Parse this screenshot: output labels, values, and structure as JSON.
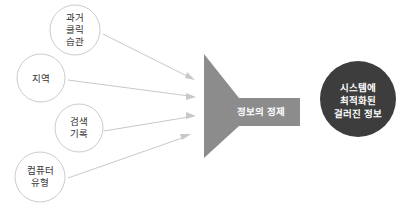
{
  "diagram": {
    "type": "funnel-flow",
    "canvas": {
      "width": 408,
      "height": 215,
      "background": "#ffffff"
    },
    "colors": {
      "input_circle_stroke": "#cccccc",
      "input_circle_fill": "#ffffff",
      "input_label": "#333333",
      "arrow": "#c8c8c8",
      "funnel": "#8c8c8c",
      "funnel_label": "#ffffff",
      "output_circle": "#3d3d3d",
      "output_label": "#ffffff"
    },
    "inputs": [
      {
        "id": "past-click-habits",
        "lines": [
          "과거",
          "클릭",
          "습관"
        ],
        "cx": 75,
        "cy": 30,
        "r": 25
      },
      {
        "id": "region",
        "lines": [
          "지역"
        ],
        "cx": 41,
        "cy": 78,
        "r": 24
      },
      {
        "id": "search-history",
        "lines": [
          "검색",
          "기록"
        ],
        "cx": 79,
        "cy": 128,
        "r": 24
      },
      {
        "id": "computer-type",
        "lines": [
          "컴퓨터",
          "유형"
        ],
        "cx": 40,
        "cy": 177,
        "r": 25
      }
    ],
    "arrows": [
      {
        "id": "arrow-past-click-habits",
        "x1": 103,
        "y1": 34,
        "x2": 194,
        "y2": 79
      },
      {
        "id": "arrow-region",
        "x1": 68,
        "y1": 80,
        "x2": 194,
        "y2": 97
      },
      {
        "id": "arrow-search-history",
        "x1": 104,
        "y1": 131,
        "x2": 194,
        "y2": 116
      },
      {
        "id": "arrow-computer-type",
        "x1": 68,
        "y1": 178,
        "x2": 190,
        "y2": 136
      }
    ],
    "funnel": {
      "id": "information-refinement",
      "label": "정보의 정제",
      "points": "204,54 204,158 239,126 300,126 300,98 239,98 204,54",
      "label_x": 260,
      "label_y": 110
    },
    "output": {
      "id": "filtered-optimized-information",
      "lines": [
        "시스템에",
        "최적화된",
        "걸러진 정보"
      ],
      "cx": 358,
      "cy": 99,
      "r": 38
    }
  }
}
